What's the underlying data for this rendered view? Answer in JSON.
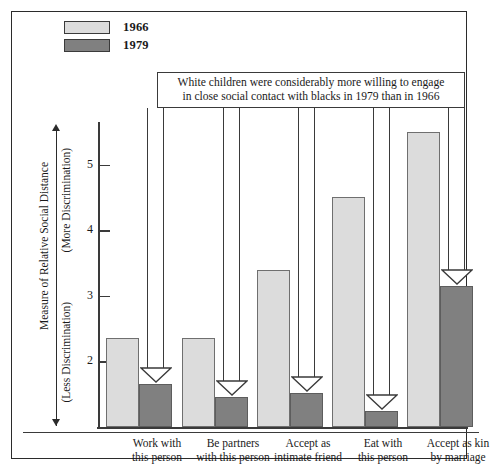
{
  "legend": {
    "items": [
      {
        "label": "1966",
        "color": "#dcdcdc",
        "icon": "legend-swatch-icon"
      },
      {
        "label": "1979",
        "color": "#808080",
        "icon": "legend-swatch-icon"
      }
    ]
  },
  "annotation": {
    "line1": "White children were considerably more willing to engage",
    "line2": "in close social contact with blacks in 1979 than in 1966"
  },
  "axis": {
    "y_title": "Measure of Relative Social Distance",
    "y_more": "(More Discrimination)",
    "y_less": "(Less Discrimination)",
    "ticks": [
      "5",
      "4",
      "3",
      "2"
    ]
  },
  "chart_data": {
    "type": "bar",
    "title": "",
    "xlabel": "",
    "ylabel": "Measure of Relative Social Distance",
    "ylim": [
      1,
      5.65
    ],
    "grid": false,
    "legend_position": "top-left",
    "categories": [
      "Work with this person",
      "Be partners with this person",
      "Accept as intimate friend",
      "Eat with this person",
      "Accept as kin by marriage"
    ],
    "series": [
      {
        "name": "1966",
        "color": "#dcdcdc",
        "values": [
          2.35,
          2.35,
          3.4,
          4.5,
          5.5
        ]
      },
      {
        "name": "1979",
        "color": "#808080",
        "values": [
          1.65,
          1.45,
          1.52,
          1.25,
          3.15
        ]
      }
    ],
    "annotations": [
      "White children were considerably more willing to engage in close social contact with blacks in 1979 than in 1966"
    ]
  }
}
